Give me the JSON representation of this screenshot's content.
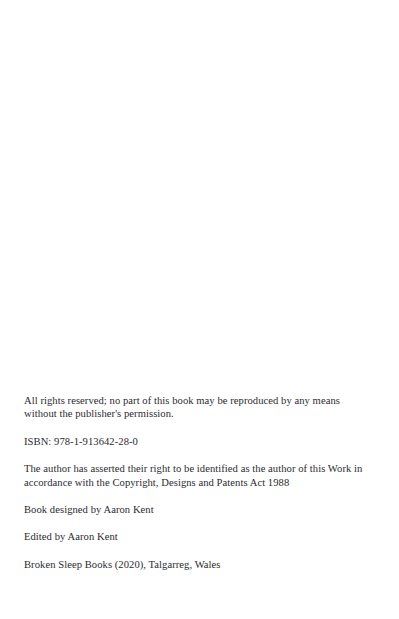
{
  "page": {
    "kind": "book-copyright-page",
    "background_color": "#ffffff",
    "text_color": "#2b2b31",
    "width": 399,
    "height": 619
  },
  "imprint": {
    "rights_notice": "All rights reserved; no part of this book may be reproduced by any means without the publisher's permission.",
    "isbn": "ISBN: 978-1-913642-28-0",
    "assertion": "The author has asserted their right to be identified as the author of this Work in accordance with the Copyright, Designs and Patents Act 1988",
    "designer": "Book designed by Aaron Kent",
    "editor": "Edited by Aaron Kent",
    "publisher": "Broken Sleep Books (2020), Talgarreg, Wales"
  }
}
